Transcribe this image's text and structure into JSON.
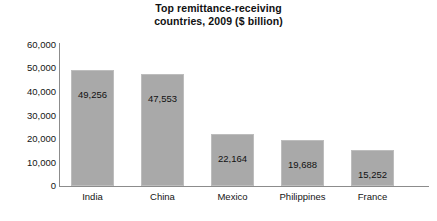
{
  "chart_data": {
    "type": "bar",
    "title": "Top remittance-receiving countries, 2009 ($ billion)",
    "title_lines": [
      "Top remittance-receiving",
      "countries, 2009 ($ billion)"
    ],
    "xlabel": "",
    "ylabel": "",
    "categories": [
      "India",
      "China",
      "Mexico",
      "Philippines",
      "France"
    ],
    "values": [
      49256,
      47553,
      22164,
      19688,
      15252
    ],
    "value_labels": [
      "49,256",
      "47,553",
      "22,164",
      "19,688",
      "15,252"
    ],
    "ylim": [
      0,
      60000
    ],
    "ytick_values": [
      60000,
      50000,
      40000,
      30000,
      20000,
      10000,
      0
    ],
    "ytick_labels": [
      "60,000",
      "50,000",
      "40,000",
      "30,000",
      "20,000",
      "10,000",
      "0"
    ],
    "grid": false,
    "legend": false,
    "legend_position": "none",
    "bar_color": "#a9a9a9",
    "bar_edge_color": "#bdbdbd",
    "axis_color": "#8c8c8c",
    "text_color": "#141414",
    "background_color": "#ffffff"
  }
}
